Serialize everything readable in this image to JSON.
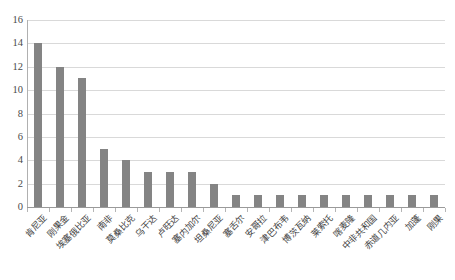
{
  "chart_data": {
    "type": "bar",
    "title": "",
    "subtitle": "",
    "xlabel": "",
    "ylabel": "",
    "ylim": [
      0,
      16
    ],
    "ytick_values": [
      0,
      2,
      4,
      6,
      8,
      10,
      12,
      14,
      16
    ],
    "ytick_labels": [
      "0",
      "2",
      "4",
      "6",
      "8",
      "10",
      "12",
      "14",
      "16"
    ],
    "grid": true,
    "legend": false,
    "legend_position": "none",
    "bar_color": "#848484",
    "gridline_color": "#d9d9d9",
    "axis_color": "#9a9a9a",
    "categories": [
      "肯尼亚",
      "刚果金",
      "埃塞俄比亚",
      "南非",
      "莫桑比克",
      "乌干达",
      "卢旺达",
      "塞内加尔",
      "坦桑尼亚",
      "塞舌尔",
      "安哥拉",
      "津巴布韦",
      "博茨瓦纳",
      "莱索托",
      "喀麦隆",
      "中非共和国",
      "赤道几内亚",
      "加蓬",
      "刚果"
    ],
    "values": [
      14,
      12,
      11,
      5,
      4,
      3,
      3,
      3,
      2,
      1,
      1,
      1,
      1,
      1,
      1,
      1,
      1,
      1,
      1
    ]
  }
}
